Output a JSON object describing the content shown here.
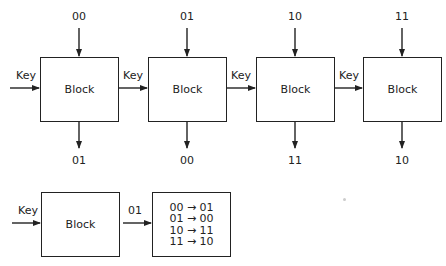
{
  "diagram": {
    "top_row": {
      "blocks": [
        {
          "label": "Block",
          "input": "00",
          "output": "01",
          "key": "Key"
        },
        {
          "label": "Block",
          "input": "01",
          "output": "00",
          "key": "Key"
        },
        {
          "label": "Block",
          "input": "10",
          "output": "11",
          "key": "Key"
        },
        {
          "label": "Block",
          "input": "11",
          "output": "10",
          "key": "Key"
        }
      ]
    },
    "bottom_row": {
      "key": "Key",
      "block_label": "Block",
      "arrow_label": "01",
      "mapping": [
        "00 → 01",
        "01 → 00",
        "10 → 11",
        "11 → 10"
      ]
    },
    "colors": {
      "stroke": "#222222",
      "background": "#ffffff"
    }
  }
}
